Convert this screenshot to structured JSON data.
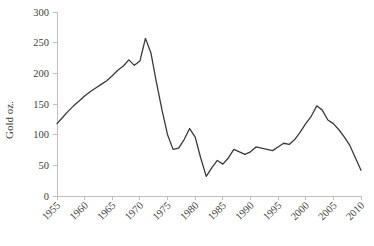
{
  "chart_data": {
    "type": "line",
    "title": "",
    "subtitle": "",
    "xlabel": "",
    "ylabel": "Gold oz.",
    "xlim": [
      1955,
      2010
    ],
    "ylim": [
      0,
      300
    ],
    "grid": false,
    "legend": false,
    "legend_position": "none",
    "y_ticks": [
      0,
      50,
      100,
      150,
      200,
      250,
      300
    ],
    "y_tick_labels": [
      "0",
      "50",
      "100",
      "150",
      "200",
      "250",
      "300"
    ],
    "x_ticks": [
      1955,
      1960,
      1965,
      1970,
      1975,
      1980,
      1985,
      1990,
      1995,
      2000,
      2005,
      2010
    ],
    "x_tick_labels": [
      "1955",
      "1960",
      "1965",
      "1970",
      "1975",
      "1980",
      "1985",
      "1990",
      "1995",
      "2000",
      "2005",
      "2010"
    ],
    "x_tick_rotation": 45,
    "series": [
      {
        "name": "Gold oz.",
        "color": "#3a3a3a",
        "x": [
          1955,
          1956,
          1957,
          1958,
          1959,
          1960,
          1961,
          1962,
          1963,
          1964,
          1965,
          1966,
          1967,
          1968,
          1969,
          1970,
          1971,
          1972,
          1973,
          1974,
          1975,
          1976,
          1977,
          1978,
          1979,
          1980,
          1981,
          1982,
          1983,
          1984,
          1985,
          1986,
          1987,
          1988,
          1989,
          1990,
          1991,
          1992,
          1993,
          1994,
          1995,
          1996,
          1997,
          1998,
          1999,
          2000,
          2001,
          2002,
          2003,
          2004,
          2005,
          2006,
          2007,
          2008,
          2009,
          2010
        ],
        "y": [
          118,
          128,
          138,
          147,
          155,
          163,
          170,
          176,
          182,
          188,
          196,
          205,
          212,
          222,
          213,
          220,
          257,
          233,
          185,
          140,
          100,
          76,
          78,
          92,
          110,
          96,
          62,
          32,
          46,
          58,
          52,
          62,
          76,
          72,
          68,
          72,
          80,
          78,
          76,
          74,
          80,
          86,
          84,
          92,
          104,
          118,
          130,
          147,
          140,
          124,
          118,
          108,
          96,
          82,
          62,
          42
        ]
      }
    ]
  },
  "axis": {
    "y_axis_title": "Gold oz."
  }
}
